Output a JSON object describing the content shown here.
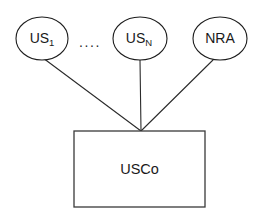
{
  "diagram": {
    "background_color": "#ffffff",
    "stroke_color": "#1c1c1c",
    "text_color": "#1a1a1a",
    "nodes": [
      {
        "id": "us1",
        "shape": "ellipse",
        "label_base": "US",
        "label_sub": "1",
        "cx": 42,
        "cy": 38.5,
        "rx": 26,
        "ry": 21.5
      },
      {
        "id": "usn",
        "shape": "ellipse",
        "label_base": "US",
        "label_sub": "N",
        "cx": 140,
        "cy": 38.5,
        "rx": 27,
        "ry": 21.5
      },
      {
        "id": "nra",
        "shape": "ellipse",
        "label_base": "NRA",
        "label_sub": "",
        "cx": 220,
        "cy": 38.5,
        "rx": 27,
        "ry": 21.5
      },
      {
        "id": "usco",
        "shape": "rectangle",
        "label_base": "USCo",
        "label_sub": "",
        "x": 74,
        "y": 131,
        "width": 131,
        "height": 76
      }
    ],
    "ellipsis": {
      "text": "....",
      "x": 90,
      "y": 42
    },
    "edges": [
      {
        "id": "edge-us1-usco",
        "from": "us1",
        "to": "usco",
        "x1": 43,
        "y1": 58,
        "x2": 141,
        "y2": 131
      },
      {
        "id": "edge-usn-usco",
        "from": "usn",
        "to": "usco",
        "x1": 140,
        "y1": 60,
        "x2": 141,
        "y2": 131
      },
      {
        "id": "edge-nra-usco",
        "from": "nra",
        "to": "usco",
        "x1": 215,
        "y1": 58,
        "x2": 141,
        "y2": 131
      }
    ]
  }
}
